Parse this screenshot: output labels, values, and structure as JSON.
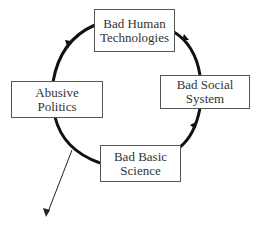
{
  "diagram": {
    "type": "cycle",
    "nodes": [
      {
        "id": "top",
        "lines": [
          "Bad Human",
          "Technologies"
        ]
      },
      {
        "id": "left",
        "lines": [
          "Abusive",
          "Politics"
        ]
      },
      {
        "id": "right",
        "lines": [
          "Bad Social",
          "System"
        ]
      },
      {
        "id": "bottom",
        "lines": [
          "Bad Basic",
          "Science"
        ]
      }
    ],
    "edges": [
      {
        "from": "bottom",
        "to": "right"
      },
      {
        "from": "right",
        "to": "top"
      },
      {
        "from": "top",
        "to": "left"
      },
      {
        "from": "left",
        "to": "bottom"
      },
      {
        "from": "cycle",
        "to": "outside",
        "style": "thin-arrow"
      }
    ]
  }
}
